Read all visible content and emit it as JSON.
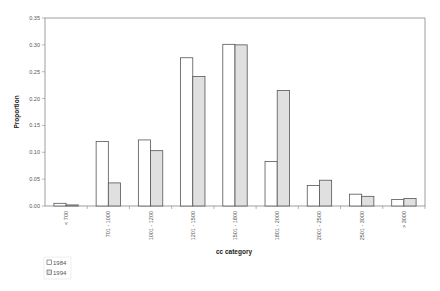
{
  "chart_data": {
    "type": "bar",
    "title": "",
    "xlabel": "cc category",
    "ylabel": "Proportion",
    "ylim": [
      0,
      0.35
    ],
    "yticks": [
      "0.00",
      "0.05",
      "0.10",
      "0.15",
      "0.20",
      "0.25",
      "0.30",
      "0.35"
    ],
    "categories": [
      "< 700",
      "701 - 1000",
      "1001 - 1200",
      "1201 - 1500",
      "1501 - 1800",
      "1801 - 2000",
      "2001 - 2500",
      "2501 - 3000",
      "> 3000"
    ],
    "series": [
      {
        "name": "1984",
        "color": "#ffffff",
        "values": [
          0.005,
          0.12,
          0.123,
          0.276,
          0.301,
          0.083,
          0.038,
          0.022,
          0.012
        ]
      },
      {
        "name": "1994",
        "color": "#e0e0e0",
        "values": [
          0.002,
          0.043,
          0.103,
          0.241,
          0.3,
          0.215,
          0.048,
          0.018,
          0.014
        ]
      }
    ],
    "grid": false,
    "legend_position": "bottom-left"
  },
  "colors": {
    "bar_stroke": "#555555",
    "axis": "#888888"
  }
}
